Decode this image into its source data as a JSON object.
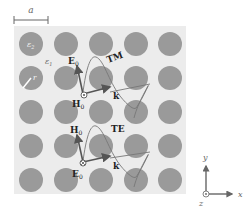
{
  "scale_bar": {
    "label": "a"
  },
  "lattice": {
    "rows": 5,
    "cols": 5,
    "rod_label": "ε",
    "rod_label_sub": "2",
    "background_label": "ε",
    "background_label_sub": "1",
    "radius_label": "r",
    "colors": {
      "panel": "#ececec",
      "rod": "#9a9a9a",
      "line": "#555555"
    }
  },
  "tm_mode": {
    "title": "TM",
    "e_field": "E",
    "e_sub": "0",
    "h_field": "H",
    "h_sub": "0",
    "k_vector": "k",
    "out_of_plane_symbol": "dot"
  },
  "te_mode": {
    "title": "TE",
    "h_field": "H",
    "h_sub": "0",
    "e_field": "E",
    "e_sub": "0",
    "k_vector": "k",
    "out_of_plane_symbol": "cross"
  },
  "axes": {
    "x": "x",
    "y": "y",
    "z": "z"
  }
}
